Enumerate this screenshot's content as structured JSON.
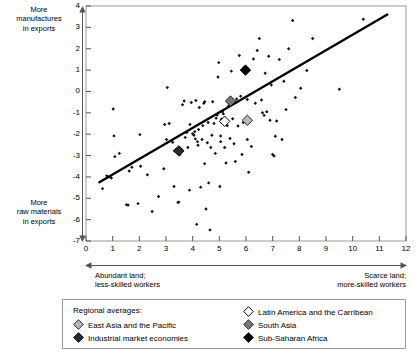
{
  "annotations": {
    "y_top": "More\nmanufactures\nin exports",
    "y_bottom": "More\nraw materials\nin exports",
    "x_left": "Abundant land;\nless-skilled workers",
    "x_right": "Scarce land;\nmore-skilled workers"
  },
  "legend": {
    "title": "Regional averages:",
    "items": [
      {
        "label": "East Asia and the Pacific",
        "color": "#b7b7b7",
        "edge": "#2b2b2b",
        "column": 1
      },
      {
        "label": "Industrial market economies",
        "color": "#2b2b2b",
        "edge": "#000000",
        "column": 1
      },
      {
        "label": "Latin America and the Carribean",
        "color": "#ffffff",
        "edge": "#000000",
        "column": 2
      },
      {
        "label": "South Asia",
        "color": "#777777",
        "edge": "#2b2b2b",
        "column": 2
      },
      {
        "label": "Sub-Saharan Africa",
        "color": "#000000",
        "edge": "#000000",
        "column": 2
      }
    ]
  },
  "colors": {
    "frame": "#9a9a9a",
    "axis": "#555555",
    "point": "#111111",
    "trend": "#000000",
    "legend_border": "#9a9a9a"
  },
  "chart_data": {
    "type": "scatter",
    "title": "",
    "xlabel": "Abundant land; less-skilled workers ↔ Scarce land; more-skilled workers",
    "ylabel": "More raw materials in exports ↔ More manufactures in exports",
    "xlim": [
      0,
      12
    ],
    "ylim": [
      -7,
      4
    ],
    "xticks": [
      0,
      1,
      2,
      3,
      4,
      5,
      6,
      7,
      8,
      9,
      10,
      11,
      12
    ],
    "yticks": [
      -7,
      -6,
      -5,
      -4,
      -3,
      -2,
      -1,
      0,
      1,
      2,
      3,
      4
    ],
    "grid": false,
    "legend_position": "below-plot",
    "trendline": {
      "type": "line",
      "x": [
        0.5,
        11.3
      ],
      "y": [
        -4.25,
        3.6
      ]
    },
    "series": [
      {
        "name": "Countries",
        "marker": "small-filled-diamond",
        "color": "#111111",
        "points": [
          [
            0.62,
            -4.55
          ],
          [
            0.78,
            -3.95
          ],
          [
            0.88,
            -4.0
          ],
          [
            1.02,
            -0.82
          ],
          [
            1.05,
            -2.08
          ],
          [
            1.08,
            -3.05
          ],
          [
            1.52,
            -5.3
          ],
          [
            1.58,
            -5.32
          ],
          [
            1.62,
            -3.72
          ],
          [
            1.72,
            -3.55
          ],
          [
            1.95,
            -5.25
          ],
          [
            2.02,
            -2.02
          ],
          [
            2.05,
            -3.5
          ],
          [
            2.48,
            -5.62
          ],
          [
            2.72,
            -4.92
          ],
          [
            2.92,
            -3.62
          ],
          [
            2.95,
            -1.55
          ],
          [
            3.02,
            -2.25
          ],
          [
            3.05,
            0.18
          ],
          [
            3.12,
            -1.5
          ],
          [
            3.25,
            -2.38
          ],
          [
            3.3,
            -4.45
          ],
          [
            3.32,
            -2.78
          ],
          [
            3.38,
            -2.72
          ],
          [
            3.45,
            -5.2
          ],
          [
            3.48,
            -5.18
          ],
          [
            3.52,
            -2.95
          ],
          [
            3.58,
            -2.72
          ],
          [
            3.62,
            -0.62
          ],
          [
            3.68,
            -0.45
          ],
          [
            3.72,
            -2.15
          ],
          [
            3.78,
            -1.92
          ],
          [
            3.82,
            -2.62
          ],
          [
            3.88,
            -4.62
          ],
          [
            3.95,
            -0.52
          ],
          [
            4.0,
            -1.98
          ],
          [
            4.05,
            -2.05
          ],
          [
            4.08,
            -1.88
          ],
          [
            4.1,
            -2.22
          ],
          [
            4.12,
            -0.42
          ],
          [
            4.15,
            -6.22
          ],
          [
            4.18,
            -2.35
          ],
          [
            4.2,
            -2.52
          ],
          [
            4.22,
            -1.78
          ],
          [
            4.25,
            -0.75
          ],
          [
            4.3,
            -4.48
          ],
          [
            4.35,
            -2.25
          ],
          [
            4.38,
            -1.6
          ],
          [
            4.42,
            -0.55
          ],
          [
            4.45,
            -3.38
          ],
          [
            4.5,
            -5.5
          ],
          [
            4.55,
            -2.4
          ],
          [
            4.58,
            -1.45
          ],
          [
            4.6,
            -4.28
          ],
          [
            4.65,
            -6.48
          ],
          [
            4.68,
            -2.62
          ],
          [
            4.72,
            -2.05
          ],
          [
            4.75,
            -0.48
          ],
          [
            4.8,
            -1.5
          ],
          [
            4.85,
            -2.9
          ],
          [
            4.88,
            -1.25
          ],
          [
            4.92,
            -1.1
          ],
          [
            4.95,
            0.68
          ],
          [
            4.98,
            1.35
          ],
          [
            5.02,
            -4.45
          ],
          [
            5.05,
            -2.35
          ],
          [
            5.08,
            -1.3
          ],
          [
            5.12,
            -0.95
          ],
          [
            5.15,
            -1.05
          ],
          [
            5.2,
            -2.62
          ],
          [
            5.25,
            -3.35
          ],
          [
            5.3,
            -1.6
          ],
          [
            5.35,
            -0.68
          ],
          [
            5.4,
            -2.2
          ],
          [
            5.45,
            0.95
          ],
          [
            5.5,
            -1.28
          ],
          [
            5.55,
            -2.45
          ],
          [
            5.6,
            -3.28
          ],
          [
            5.65,
            -0.35
          ],
          [
            5.7,
            -1.62
          ],
          [
            5.75,
            1.68
          ],
          [
            5.8,
            -0.22
          ],
          [
            5.85,
            -2.95
          ],
          [
            5.9,
            -1.45
          ],
          [
            5.95,
            1.02
          ],
          [
            6.0,
            0.98
          ],
          [
            6.05,
            -0.38
          ],
          [
            6.1,
            -3.78
          ],
          [
            6.2,
            -2.58
          ],
          [
            6.28,
            1.52
          ],
          [
            6.35,
            -0.55
          ],
          [
            6.42,
            1.92
          ],
          [
            6.5,
            2.48
          ],
          [
            6.58,
            -0.4
          ],
          [
            6.62,
            -1.0
          ],
          [
            6.68,
            -1.12
          ],
          [
            6.72,
            0.85
          ],
          [
            6.78,
            -0.95
          ],
          [
            6.85,
            1.65
          ],
          [
            6.9,
            -1.35
          ],
          [
            6.95,
            0.3
          ],
          [
            7.0,
            -2.95
          ],
          [
            7.05,
            -3.02
          ],
          [
            7.1,
            -2.1
          ],
          [
            7.15,
            -1.38
          ],
          [
            7.25,
            1.5
          ],
          [
            7.35,
            -2.25
          ],
          [
            7.42,
            0.48
          ],
          [
            7.5,
            -0.85
          ],
          [
            7.6,
            2.0
          ],
          [
            7.75,
            3.32
          ],
          [
            7.85,
            -0.28
          ],
          [
            8.05,
            0.15
          ],
          [
            8.28,
            0.98
          ],
          [
            8.5,
            2.48
          ],
          [
            9.5,
            0.1
          ],
          [
            10.4,
            3.38
          ],
          [
            2.3,
            -3.9
          ],
          [
            1.25,
            -2.9
          ],
          [
            0.95,
            -4.05
          ],
          [
            5.05,
            -2.08
          ],
          [
            4.45,
            -0.48
          ],
          [
            6.05,
            -2.25
          ],
          [
            3.9,
            -1.55
          ]
        ]
      },
      {
        "name": "Regional averages",
        "marker": "large-diamond",
        "points": [
          {
            "label": "South Asia",
            "x": 5.42,
            "y": -0.45,
            "color": "#777777",
            "edge": "#2b2b2b"
          },
          {
            "label": "Latin America and the Carribean",
            "x": 5.2,
            "y": -1.4,
            "color": "#ffffff",
            "edge": "#000000"
          },
          {
            "label": "East Asia and the Pacific",
            "x": 6.05,
            "y": -1.35,
            "color": "#b7b7b7",
            "edge": "#2b2b2b"
          },
          {
            "label": "Sub-Saharan Africa",
            "x": 5.98,
            "y": 1.0,
            "color": "#000000",
            "edge": "#000000"
          },
          {
            "label": "Industrial market economies",
            "x": 3.48,
            "y": -2.78,
            "color": "#2b2b2b",
            "edge": "#000000"
          }
        ]
      }
    ]
  }
}
